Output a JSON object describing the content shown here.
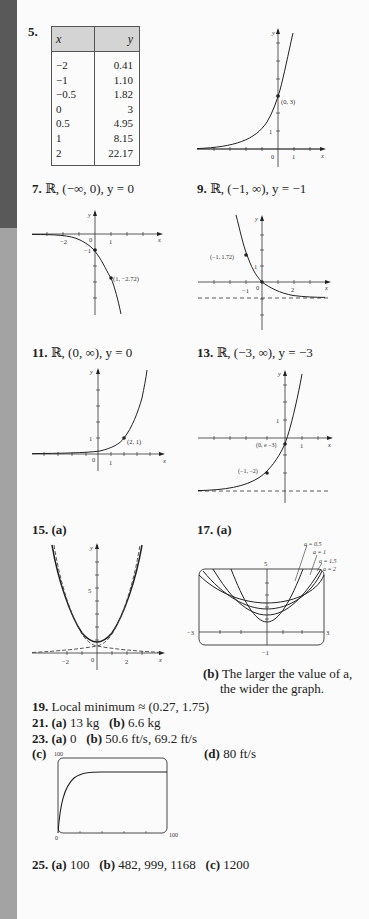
{
  "items": {
    "p5": {
      "number": "5.",
      "table": {
        "headers": [
          "x",
          "y"
        ],
        "rows": [
          [
            "−2",
            "0.41"
          ],
          [
            "−1",
            "1.10"
          ],
          [
            "−0.5",
            "1.82"
          ],
          [
            "0",
            "3"
          ],
          [
            "0.5",
            "4.95"
          ],
          [
            "1",
            "8.15"
          ],
          [
            "2",
            "22.17"
          ]
        ]
      },
      "graph": {
        "point_label": "(0, 3)",
        "tick_label_y": "1",
        "tick_label_x0": "0",
        "tick_label_x1": "1",
        "axis_x": "x",
        "axis_y": "y"
      }
    },
    "p7": {
      "number": "7.",
      "answer": "ℝ, (−∞, 0), y = 0",
      "graph": {
        "point_label": "(1, −2.72)",
        "y_intercept_label": "−1",
        "tick_neg2": "−2",
        "tick_0": "0",
        "tick_1": "1",
        "axis_x": "x",
        "axis_y": "y"
      }
    },
    "p9": {
      "number": "9.",
      "answer": "ℝ, (−1, ∞), y = −1",
      "graph": {
        "point_label": "(−1, 1.72)",
        "tick_y1": "1",
        "tick_neg1": "−1",
        "tick_0": "0",
        "tick_2": "2",
        "axis_x": "x",
        "axis_y": "y"
      }
    },
    "p11": {
      "number": "11.",
      "answer": "ℝ, (0, ∞), y = 0",
      "graph": {
        "point_label": "(2, 1)",
        "tick_y1": "1",
        "tick_0": "0",
        "tick_1": "1",
        "axis_x": "x",
        "axis_y": "y"
      }
    },
    "p13": {
      "number": "13.",
      "answer": "ℝ, (−3, ∞), y = −3",
      "graph": {
        "point1_label": "(0, e −3)",
        "point2_label": "(−1, −2)",
        "tick_y1": "1",
        "tick_1": "1",
        "axis_x": "x",
        "axis_y": "y"
      }
    },
    "p15": {
      "number": "15.",
      "part": "(a)",
      "graph": {
        "tick_y5": "5",
        "tick_neg2": "−2",
        "tick_0": "0",
        "tick_2": "2",
        "axis_x": "x",
        "axis_y": "y"
      }
    },
    "p17": {
      "number": "17.",
      "part_a": "(a)",
      "graph": {
        "legend": [
          "a = 0.5",
          "a = 1",
          "a = 1.5",
          "a = 2"
        ],
        "ymax": "5",
        "ymin": "−1",
        "xmin": "−3",
        "xmax": "3"
      },
      "part_b": "(b)",
      "part_b_text_line1": "The larger the value of a,",
      "part_b_text_line2": "the wider the graph."
    },
    "p19": {
      "number": "19.",
      "text": "Local minimum ≈ (0.27, 1.75)"
    },
    "p21": {
      "number": "21.",
      "a_label": "(a)",
      "a_value": "13 kg",
      "b_label": "(b)",
      "b_value": "6.6 kg"
    },
    "p23": {
      "number": "23.",
      "a_label": "(a)",
      "a_value": "0",
      "b_label": "(b)",
      "b_value": "50.6 ft/s, 69.2 ft/s",
      "c_label": "(c)",
      "c_graph": {
        "y_max": "100",
        "x_min": "0",
        "x_max": "100"
      },
      "d_label": "(d)",
      "d_value": "80 ft/s"
    },
    "p25": {
      "number": "25.",
      "a_label": "(a)",
      "a_value": "100",
      "b_label": "(b)",
      "b_value": "482, 999, 1168",
      "c_label": "(c)",
      "c_value": "1200"
    }
  },
  "colors": {
    "sidebar_dark": "#595959",
    "sidebar_light": "#a3a3a3",
    "page": "#fbfbfb",
    "ink": "#222222",
    "table_header": "#d4d4d4"
  }
}
